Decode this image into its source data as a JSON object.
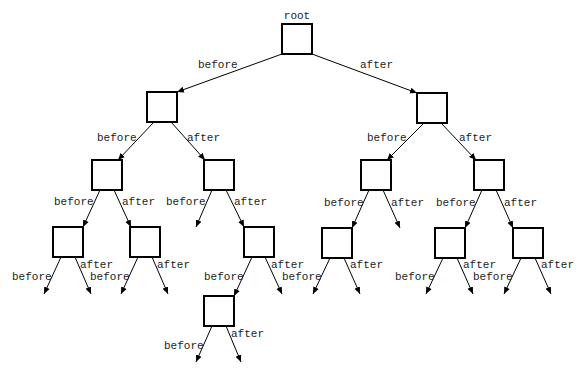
{
  "diagram": {
    "type": "binary-tree",
    "root_label": "root",
    "edge_labels": {
      "left": "before",
      "right": "after"
    },
    "node_size": 30,
    "colors": {
      "stroke": "#000000",
      "text": "#222222",
      "background": "#ffffff"
    },
    "nodes": [
      {
        "id": "root",
        "x": 282,
        "y": 24,
        "label": "root"
      },
      {
        "id": "L",
        "x": 147,
        "y": 92
      },
      {
        "id": "R",
        "x": 417,
        "y": 93
      },
      {
        "id": "LL",
        "x": 92,
        "y": 160
      },
      {
        "id": "LR",
        "x": 204,
        "y": 160
      },
      {
        "id": "RL",
        "x": 361,
        "y": 160
      },
      {
        "id": "RR",
        "x": 474,
        "y": 160
      },
      {
        "id": "LLL",
        "x": 53,
        "y": 227
      },
      {
        "id": "LLR",
        "x": 130,
        "y": 227
      },
      {
        "id": "LRR",
        "x": 244,
        "y": 227
      },
      {
        "id": "RLL",
        "x": 322,
        "y": 228
      },
      {
        "id": "RRL",
        "x": 435,
        "y": 228
      },
      {
        "id": "RRR",
        "x": 513,
        "y": 228
      },
      {
        "id": "LRRL",
        "x": 204,
        "y": 296
      }
    ],
    "edges": [
      {
        "from": "root",
        "to": "L",
        "label": "before",
        "x1": 282,
        "y1": 54,
        "x2": 177,
        "y2": 92,
        "lx": 198,
        "ly": 68
      },
      {
        "from": "root",
        "to": "R",
        "label": "after",
        "x1": 312,
        "y1": 54,
        "x2": 417,
        "y2": 93,
        "lx": 360,
        "ly": 68
      },
      {
        "from": "L",
        "to": "LL",
        "label": "before",
        "x1": 154,
        "y1": 122,
        "x2": 118,
        "y2": 160,
        "lx": 97,
        "ly": 141
      },
      {
        "from": "L",
        "to": "LR",
        "label": "after",
        "x1": 171,
        "y1": 122,
        "x2": 205,
        "y2": 160,
        "lx": 187,
        "ly": 141
      },
      {
        "from": "R",
        "to": "RL",
        "label": "before",
        "x1": 424,
        "y1": 123,
        "x2": 387,
        "y2": 160,
        "lx": 367,
        "ly": 141
      },
      {
        "from": "R",
        "to": "RR",
        "label": "after",
        "x1": 441,
        "y1": 123,
        "x2": 476,
        "y2": 160,
        "lx": 459,
        "ly": 141
      },
      {
        "from": "LL",
        "to": "LLL",
        "label": "before",
        "x1": 100,
        "y1": 190,
        "x2": 83,
        "y2": 227,
        "lx": 54,
        "ly": 205
      },
      {
        "from": "LL",
        "to": "LLR",
        "label": "after",
        "x1": 114,
        "y1": 190,
        "x2": 131,
        "y2": 227,
        "lx": 122,
        "ly": 205
      },
      {
        "from": "LR",
        "to": null,
        "label": "before",
        "x1": 212,
        "y1": 190,
        "x2": 196,
        "y2": 227,
        "lx": 166,
        "ly": 205
      },
      {
        "from": "LR",
        "to": "LRR",
        "label": "after",
        "x1": 226,
        "y1": 190,
        "x2": 244,
        "y2": 227,
        "lx": 234,
        "ly": 205
      },
      {
        "from": "RL",
        "to": "RLL",
        "label": "before",
        "x1": 369,
        "y1": 190,
        "x2": 352,
        "y2": 228,
        "lx": 324,
        "ly": 206
      },
      {
        "from": "RL",
        "to": null,
        "label": "after",
        "x1": 383,
        "y1": 190,
        "x2": 400,
        "y2": 228,
        "lx": 391,
        "ly": 206
      },
      {
        "from": "RR",
        "to": "RRL",
        "label": "before",
        "x1": 482,
        "y1": 190,
        "x2": 465,
        "y2": 228,
        "lx": 436,
        "ly": 206
      },
      {
        "from": "RR",
        "to": "RRR",
        "label": "after",
        "x1": 496,
        "y1": 190,
        "x2": 513,
        "y2": 228,
        "lx": 504,
        "ly": 206
      },
      {
        "from": "LLL",
        "to": null,
        "label": "before",
        "x1": 61,
        "y1": 257,
        "x2": 44,
        "y2": 294,
        "lx": 12,
        "ly": 280
      },
      {
        "from": "LLL",
        "to": null,
        "label": "after",
        "x1": 75,
        "y1": 257,
        "x2": 91,
        "y2": 294,
        "lx": 80,
        "ly": 268
      },
      {
        "from": "LLR",
        "to": null,
        "label": "before",
        "x1": 138,
        "y1": 257,
        "x2": 121,
        "y2": 294,
        "lx": 90,
        "ly": 280
      },
      {
        "from": "LLR",
        "to": null,
        "label": "after",
        "x1": 152,
        "y1": 257,
        "x2": 168,
        "y2": 294,
        "lx": 157,
        "ly": 268
      },
      {
        "from": "LRR",
        "to": "LRRL",
        "label": "before",
        "x1": 252,
        "y1": 257,
        "x2": 234,
        "y2": 296,
        "lx": 204,
        "ly": 280
      },
      {
        "from": "LRR",
        "to": null,
        "label": "after",
        "x1": 265,
        "y1": 257,
        "x2": 282,
        "y2": 294,
        "lx": 271,
        "ly": 268
      },
      {
        "from": "RLL",
        "to": null,
        "label": "before",
        "x1": 330,
        "y1": 258,
        "x2": 313,
        "y2": 294,
        "lx": 282,
        "ly": 280
      },
      {
        "from": "RLL",
        "to": null,
        "label": "after",
        "x1": 344,
        "y1": 258,
        "x2": 360,
        "y2": 294,
        "lx": 350,
        "ly": 268
      },
      {
        "from": "RRL",
        "to": null,
        "label": "before",
        "x1": 443,
        "y1": 258,
        "x2": 426,
        "y2": 294,
        "lx": 395,
        "ly": 280
      },
      {
        "from": "RRL",
        "to": null,
        "label": "after",
        "x1": 457,
        "y1": 258,
        "x2": 473,
        "y2": 294,
        "lx": 463,
        "ly": 268
      },
      {
        "from": "RRR",
        "to": null,
        "label": "before",
        "x1": 521,
        "y1": 258,
        "x2": 504,
        "y2": 294,
        "lx": 473,
        "ly": 280
      },
      {
        "from": "RRR",
        "to": null,
        "label": "after",
        "x1": 535,
        "y1": 258,
        "x2": 551,
        "y2": 294,
        "lx": 541,
        "ly": 268
      },
      {
        "from": "LRRL",
        "to": null,
        "label": "before",
        "x1": 212,
        "y1": 326,
        "x2": 196,
        "y2": 362,
        "lx": 164,
        "ly": 349
      },
      {
        "from": "LRRL",
        "to": null,
        "label": "after",
        "x1": 226,
        "y1": 326,
        "x2": 241,
        "y2": 362,
        "lx": 231,
        "ly": 337
      }
    ]
  }
}
